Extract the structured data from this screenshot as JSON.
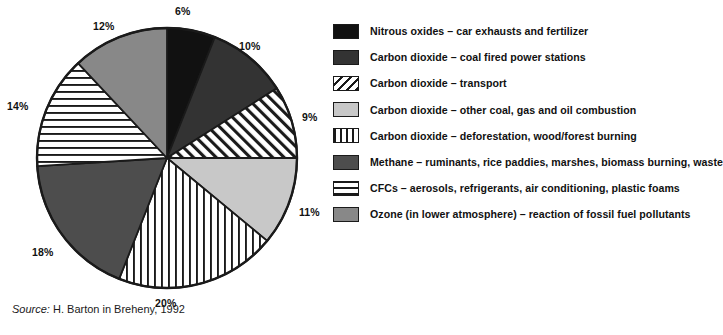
{
  "chart_data": {
    "type": "pie",
    "title": "",
    "subtitle": "",
    "xlabel": "",
    "ylabel": "",
    "legend_position": "right",
    "grid": false,
    "start_angle_deg": 0,
    "direction": "clockwise",
    "categories": [
      "Nitrous oxides – car exhausts and fertilizer",
      "Carbon dioxide – coal fired power stations",
      "Carbon dioxide – transport",
      "Carbon dioxide – other coal, gas and oil combustion",
      "Carbon dioxide – deforestation, wood/forest burning",
      "Methane – ruminants, rice paddies, marshes, biomass burning, waste",
      "CFCs – aerosols, refrigerants, air conditioning, plastic foams",
      "Ozone (in lower atmosphere) – reaction of fossil fuel pollutants"
    ],
    "values": [
      6,
      10,
      9,
      11,
      20,
      18,
      14,
      12
    ],
    "data_labels": [
      "6%",
      "10%",
      "9%",
      "11%",
      "20%",
      "18%",
      "14%",
      "12%"
    ],
    "slices": [
      {
        "label": "Nitrous oxides – car exhausts and fertilizer",
        "value": 6,
        "data_label": "6%",
        "fill": "solid",
        "color": "#111111"
      },
      {
        "label": "Carbon dioxide – coal fired power stations",
        "value": 10,
        "data_label": "10%",
        "fill": "solid",
        "color": "#333333"
      },
      {
        "label": "Carbon dioxide – transport",
        "value": 9,
        "data_label": "9%",
        "fill": "diagonal-hatch",
        "color": "#ffffff"
      },
      {
        "label": "Carbon dioxide – other coal, gas and oil combustion",
        "value": 11,
        "data_label": "11%",
        "fill": "solid",
        "color": "#c8c8c8"
      },
      {
        "label": "Carbon dioxide – deforestation, wood/forest burning",
        "value": 20,
        "data_label": "20%",
        "fill": "vertical-stripes",
        "color": "#ffffff"
      },
      {
        "label": "Methane – ruminants, rice paddies, marshes, biomass burning, waste",
        "value": 18,
        "data_label": "18%",
        "fill": "solid",
        "color": "#4d4d4d"
      },
      {
        "label": "CFCs – aerosols, refrigerants, air conditioning, plastic foams",
        "value": 14,
        "data_label": "14%",
        "fill": "horizontal-stripes",
        "color": "#ffffff"
      },
      {
        "label": "Ozone (in lower atmosphere) – reaction of fossil fuel pollutants",
        "value": 12,
        "data_label": "12%",
        "fill": "solid",
        "color": "#888888"
      }
    ]
  },
  "legend": {
    "items": [
      {
        "label": "Nitrous oxides – car exhausts and fertilizer",
        "swatch": "solid-black-swatch"
      },
      {
        "label": "Carbon dioxide – coal fired power stations",
        "swatch": "solid-darkgray-swatch"
      },
      {
        "label": "Carbon dioxide – transport",
        "swatch": "diagonal-hatch-swatch"
      },
      {
        "label": "Carbon dioxide – other coal, gas and oil combustion",
        "swatch": "solid-lightgray-swatch"
      },
      {
        "label": "Carbon dioxide – deforestation, wood/forest burning",
        "swatch": "vertical-stripes-swatch"
      },
      {
        "label": "Methane – ruminants, rice paddies, marshes, biomass burning, waste",
        "swatch": "solid-midgray-swatch"
      },
      {
        "label": "CFCs – aerosols, refrigerants, air conditioning, plastic foams",
        "swatch": "horizontal-stripes-swatch"
      },
      {
        "label": "Ozone (in lower atmosphere) – reaction of fossil fuel pollutants",
        "swatch": "solid-gray-swatch"
      }
    ]
  },
  "source": {
    "prefix": "Source:",
    "text": "H. Barton in Breheny, 1992"
  },
  "colors": {
    "outline": "#1a1a1a",
    "black": "#111111",
    "dark_charcoal": "#333333",
    "methane_gray": "#4d4d4d",
    "ozone_gray": "#888888",
    "light_gray": "#c8c8c8",
    "background": "#ffffff"
  }
}
